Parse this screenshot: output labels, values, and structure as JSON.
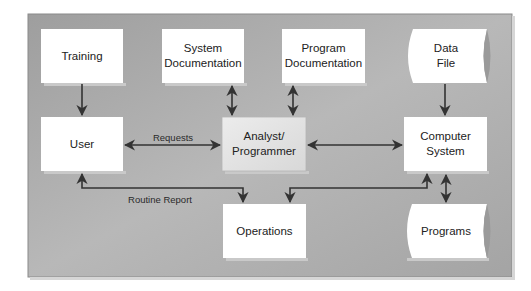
{
  "diagram": {
    "type": "system-context-flow",
    "nodes": {
      "training": {
        "label_lines": [
          "Training"
        ],
        "shape": "rectangle"
      },
      "system_doc": {
        "label_lines": [
          "System",
          "Documentation"
        ],
        "shape": "rectangle"
      },
      "program_doc": {
        "label_lines": [
          "Program",
          "Documentation"
        ],
        "shape": "rectangle"
      },
      "data_file": {
        "label_lines": [
          "Data",
          "File"
        ],
        "shape": "stored-data"
      },
      "user": {
        "label_lines": [
          "User"
        ],
        "shape": "rectangle"
      },
      "analyst": {
        "label_lines": [
          "Analyst/",
          "Programmer"
        ],
        "shape": "rectangle",
        "highlighted": true
      },
      "computer_system": {
        "label_lines": [
          "Computer",
          "System"
        ],
        "shape": "rectangle"
      },
      "operations": {
        "label_lines": [
          "Operations"
        ],
        "shape": "rectangle"
      },
      "programs": {
        "label_lines": [
          "Programs"
        ],
        "shape": "stored-data"
      }
    },
    "edges": [
      {
        "from": "training",
        "to": "user",
        "direction": "one-way",
        "label": ""
      },
      {
        "from": "system_doc",
        "to": "analyst",
        "direction": "two-way",
        "label": ""
      },
      {
        "from": "program_doc",
        "to": "analyst",
        "direction": "two-way",
        "label": ""
      },
      {
        "from": "data_file",
        "to": "computer_system",
        "direction": "one-way",
        "label": ""
      },
      {
        "from": "user",
        "to": "analyst",
        "direction": "two-way",
        "label": "Requests"
      },
      {
        "from": "analyst",
        "to": "computer_system",
        "direction": "two-way",
        "label": ""
      },
      {
        "from": "operations",
        "to": "user",
        "direction": "two-way",
        "label": "Routine Report"
      },
      {
        "from": "computer_system",
        "to": "operations",
        "direction": "two-way",
        "label": ""
      },
      {
        "from": "computer_system",
        "to": "programs",
        "direction": "two-way",
        "label": ""
      }
    ],
    "colors": {
      "panel": "#a9a9a9",
      "box_fill": "#ffffff",
      "highlight_fill": "#e4e4e4",
      "arrow": "#333333"
    }
  }
}
